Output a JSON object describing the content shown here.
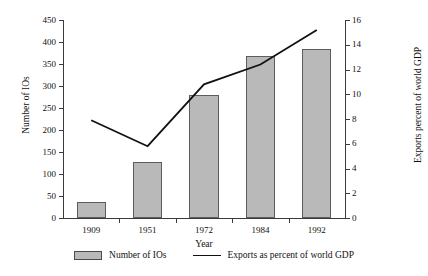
{
  "chart_data": {
    "type": "bar",
    "title": "",
    "subtitle": "",
    "xlabel": "Year",
    "categories": [
      "1909",
      "1951",
      "1972",
      "1984",
      "1992"
    ],
    "axes": {
      "left": {
        "label": "Number of IOs",
        "min": 0,
        "max": 450,
        "step": 50,
        "ticks": [
          "0",
          "50",
          "100",
          "150",
          "200",
          "250",
          "300",
          "350",
          "400",
          "450"
        ]
      },
      "right": {
        "label": "Exports percent of world GDP",
        "min": 0,
        "max": 16,
        "step": 2,
        "ticks": [
          "0",
          "2",
          "4",
          "6",
          "8",
          "10",
          "12",
          "14",
          "16"
        ]
      }
    },
    "grid": false,
    "legend_position": "bottom",
    "series": [
      {
        "name": "Number of IOs",
        "type": "bar",
        "axis": "left",
        "color": "#b9b9b9",
        "border_color": "#5d5d5d",
        "values": [
          37,
          128,
          280,
          368,
          385
        ]
      },
      {
        "name": "Exports as percent of world GDP",
        "type": "line",
        "axis": "right",
        "color": "#111111",
        "values": [
          7.9,
          5.8,
          10.8,
          12.4,
          15.2
        ]
      }
    ]
  },
  "legend": {
    "items": [
      {
        "label": "Number of IOs",
        "marker": "bar-swatch"
      },
      {
        "label": "Exports as percent of world GDP",
        "marker": "line-swatch"
      }
    ]
  }
}
